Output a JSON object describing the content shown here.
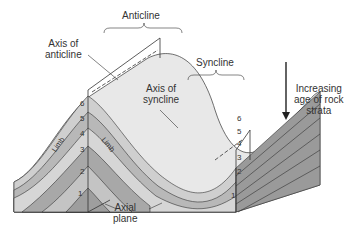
{
  "diagram": {
    "type": "geologic-fold-block-diagram",
    "labels": {
      "anticline": "Anticline",
      "syncline": "Syncline",
      "axis_of_anticline_l1": "Axis of",
      "axis_of_anticline_l2": "anticline",
      "axis_of_syncline_l1": "Axis of",
      "axis_of_syncline_l2": "syncline",
      "axial_plane_l1": "Axial",
      "axial_plane_l2": "plane",
      "limb": "Limb",
      "age_l1": "Increasing",
      "age_l2": "age of rock",
      "age_l3": "strata"
    },
    "strata_numbers_left": [
      "6",
      "5",
      "4",
      "3",
      "2",
      "1"
    ],
    "strata_numbers_right": [
      "6",
      "5",
      "4",
      "3",
      "2",
      "1"
    ],
    "colors": {
      "top_surface": "#e6e6e6",
      "layer_light": "#d2d2d2",
      "layer_mid": "#b4b4b4",
      "layer_dark": "#9a9a9a",
      "side_face": "#8c8c8c",
      "outline": "#333333"
    }
  }
}
